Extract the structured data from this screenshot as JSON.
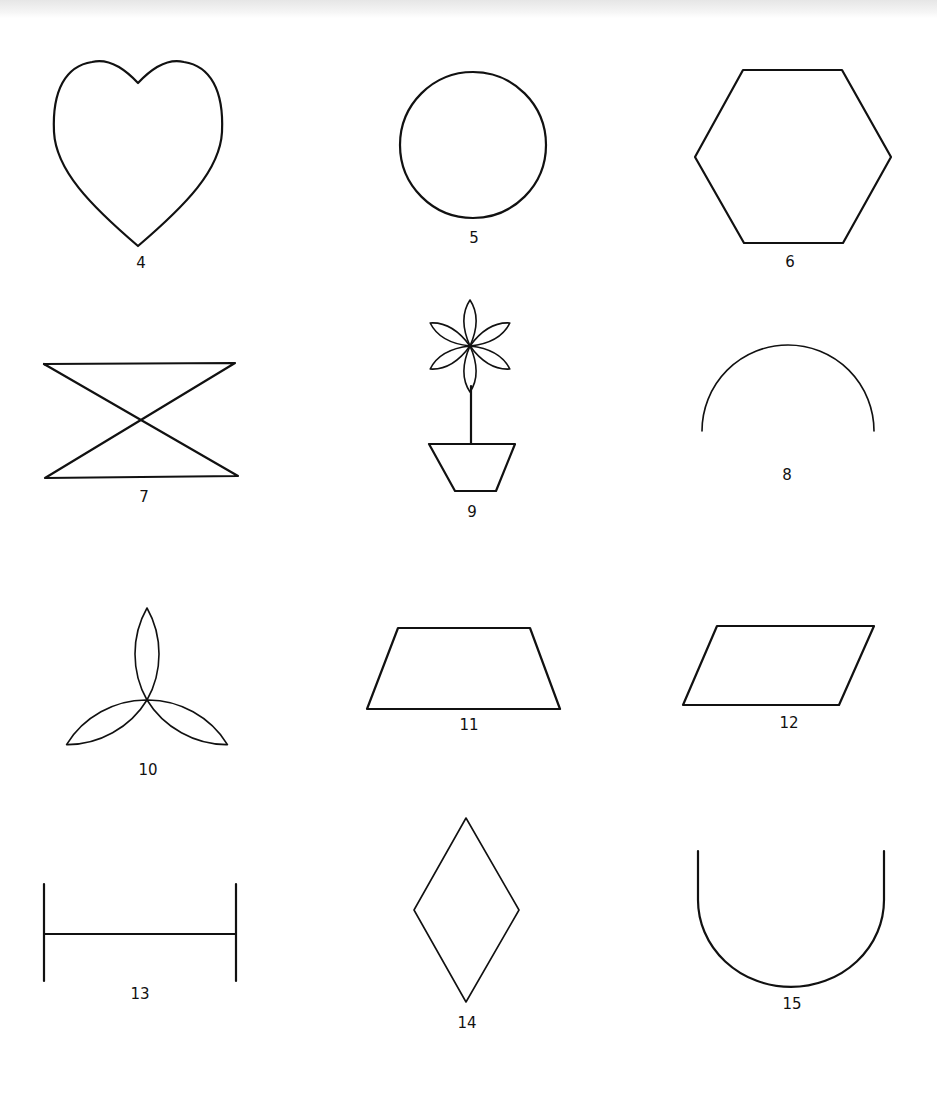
{
  "figures": [
    {
      "id": 4,
      "label": "4",
      "shape": "heart"
    },
    {
      "id": 5,
      "label": "5",
      "shape": "circle"
    },
    {
      "id": 6,
      "label": "6",
      "shape": "hexagon"
    },
    {
      "id": 7,
      "label": "7",
      "shape": "hourglass (crossed lines with top and bottom bars)"
    },
    {
      "id": 8,
      "label": "8",
      "shape": "semicircle arc"
    },
    {
      "id": 9,
      "label": "9",
      "shape": "flower in pot"
    },
    {
      "id": 10,
      "label": "10",
      "shape": "three-petal trefoil"
    },
    {
      "id": 11,
      "label": "11",
      "shape": "trapezoid"
    },
    {
      "id": 12,
      "label": "12",
      "shape": "parallelogram"
    },
    {
      "id": 13,
      "label": "13",
      "shape": "horizontal line with vertical end bars"
    },
    {
      "id": 14,
      "label": "14",
      "shape": "diamond"
    },
    {
      "id": 15,
      "label": "15",
      "shape": "U-shape"
    }
  ],
  "colors": {
    "stroke": "#111111",
    "background": "#ffffff"
  }
}
